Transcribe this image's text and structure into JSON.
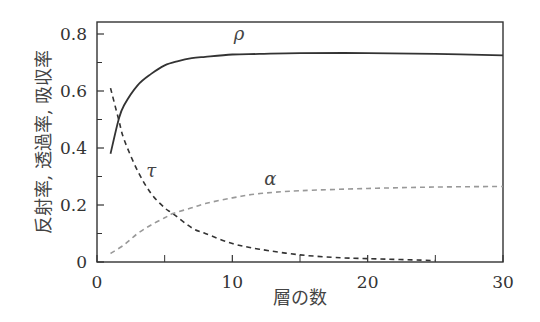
{
  "chart_data": {
    "type": "line",
    "title": "",
    "xlabel": "層の数",
    "ylabel": "反射率, 透過率, 吸収率",
    "xlim": [
      0,
      30
    ],
    "ylim": [
      0,
      0.85
    ],
    "xticks": [
      0,
      10,
      20,
      30
    ],
    "xticks_labels": [
      "0",
      "10",
      "20",
      "30"
    ],
    "xminor_ticks": [
      5,
      15,
      25
    ],
    "yticks": [
      0,
      0.2,
      0.4,
      0.6,
      0.8
    ],
    "yticks_labels": [
      "0",
      "0.2",
      "0.4",
      "0.6",
      "0.8"
    ],
    "yminor_ticks": [
      0.1,
      0.3,
      0.5,
      0.7
    ],
    "grid": false,
    "legend": "inline labels",
    "series": [
      {
        "name": "ρ",
        "style": "solid",
        "color": "#333333",
        "x": [
          1,
          1.6,
          2,
          3,
          4,
          5,
          6,
          7,
          8,
          10,
          12,
          15,
          20,
          25,
          30
        ],
        "y": [
          0.38,
          0.5,
          0.55,
          0.62,
          0.66,
          0.69,
          0.705,
          0.715,
          0.72,
          0.728,
          0.73,
          0.733,
          0.733,
          0.73,
          0.725
        ]
      },
      {
        "name": "τ",
        "style": "dashed",
        "color": "#333333",
        "x": [
          1,
          1.6,
          2,
          3,
          4,
          5,
          5.6,
          7,
          8,
          10,
          12,
          15,
          18,
          20,
          25
        ],
        "y": [
          0.61,
          0.5,
          0.43,
          0.32,
          0.24,
          0.19,
          0.17,
          0.12,
          0.1,
          0.065,
          0.045,
          0.025,
          0.015,
          0.012,
          0.005
        ]
      },
      {
        "name": "α",
        "style": "dashed",
        "color": "#999999",
        "x": [
          1,
          2,
          3,
          4,
          5,
          5.6,
          7,
          8,
          10,
          12,
          15,
          20,
          25,
          30
        ],
        "y": [
          0.03,
          0.06,
          0.1,
          0.13,
          0.155,
          0.17,
          0.19,
          0.205,
          0.225,
          0.24,
          0.25,
          0.258,
          0.263,
          0.265
        ]
      }
    ],
    "annotations": [
      {
        "text": "ρ",
        "x": 10.5,
        "y": 0.78
      },
      {
        "text": "τ",
        "x": 4,
        "y": 0.3
      },
      {
        "text": "α",
        "x": 12.8,
        "y": 0.27
      }
    ]
  }
}
